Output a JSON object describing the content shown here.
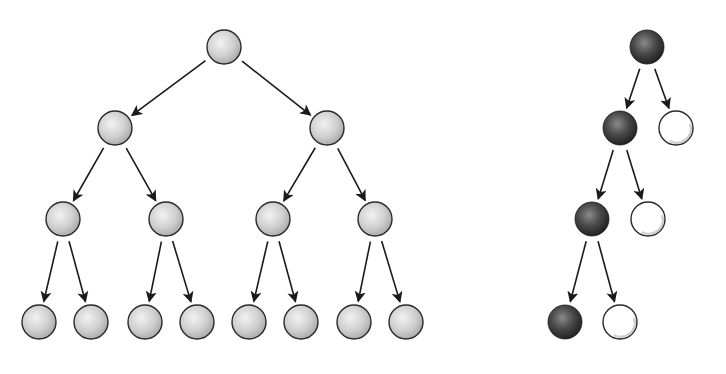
{
  "diagram": {
    "title": "",
    "colors": {
      "background": "#ffffff",
      "gray_node": "#c8c8c8",
      "dark_node": "#3a3a3a",
      "white_node": "#ffffff",
      "stroke": "#2a2a2a",
      "edge": "#1a1a1a"
    },
    "trees": [
      {
        "id": "complete-binary-tree",
        "description": "Complete binary tree of depth 3 with 15 gray nodes",
        "nodes": [
          {
            "id": "n0",
            "level": 0,
            "style": "gray",
            "parent": null
          },
          {
            "id": "n1",
            "level": 1,
            "style": "gray",
            "parent": "n0"
          },
          {
            "id": "n2",
            "level": 1,
            "style": "gray",
            "parent": "n0"
          },
          {
            "id": "n3",
            "level": 2,
            "style": "gray",
            "parent": "n1"
          },
          {
            "id": "n4",
            "level": 2,
            "style": "gray",
            "parent": "n1"
          },
          {
            "id": "n5",
            "level": 2,
            "style": "gray",
            "parent": "n2"
          },
          {
            "id": "n6",
            "level": 2,
            "style": "gray",
            "parent": "n2"
          },
          {
            "id": "n7",
            "level": 3,
            "style": "gray",
            "parent": "n3"
          },
          {
            "id": "n8",
            "level": 3,
            "style": "gray",
            "parent": "n3"
          },
          {
            "id": "n9",
            "level": 3,
            "style": "gray",
            "parent": "n4"
          },
          {
            "id": "n10",
            "level": 3,
            "style": "gray",
            "parent": "n4"
          },
          {
            "id": "n11",
            "level": 3,
            "style": "gray",
            "parent": "n5"
          },
          {
            "id": "n12",
            "level": 3,
            "style": "gray",
            "parent": "n5"
          },
          {
            "id": "n13",
            "level": 3,
            "style": "gray",
            "parent": "n6"
          },
          {
            "id": "n14",
            "level": 3,
            "style": "gray",
            "parent": "n6"
          }
        ]
      },
      {
        "id": "degenerate-tree",
        "description": "Left-leaning chain of dark nodes, each with a white right child",
        "nodes": [
          {
            "id": "d0",
            "level": 0,
            "style": "dark",
            "parent": null
          },
          {
            "id": "d1",
            "level": 1,
            "style": "dark",
            "parent": "d0"
          },
          {
            "id": "w1",
            "level": 1,
            "style": "white",
            "parent": "d0"
          },
          {
            "id": "d2",
            "level": 2,
            "style": "dark",
            "parent": "d1"
          },
          {
            "id": "w2",
            "level": 2,
            "style": "white",
            "parent": "d1"
          },
          {
            "id": "d3",
            "level": 3,
            "style": "dark",
            "parent": "d2"
          },
          {
            "id": "w3",
            "level": 3,
            "style": "white",
            "parent": "d2"
          }
        ]
      }
    ]
  }
}
